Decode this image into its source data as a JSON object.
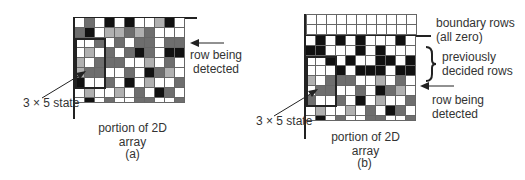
{
  "panels": [
    {
      "id": "a",
      "caption": "(a)",
      "array_label_line1": "portion of 2D",
      "array_label_line2": "array",
      "state_label": "3 × 5 state",
      "row_label_line1": "row being",
      "row_label_line2": "detected",
      "grid": [
        [
          0,
          2,
          0,
          3,
          0,
          3,
          0,
          0,
          1,
          3,
          0
        ],
        [
          2,
          3,
          0,
          1,
          1,
          2,
          1,
          2,
          0,
          0,
          0
        ],
        [
          0,
          0,
          2,
          0,
          2,
          0,
          2,
          2,
          0,
          2,
          2
        ],
        [
          0,
          1,
          0,
          2,
          0,
          2,
          3,
          2,
          0,
          3,
          3
        ],
        [
          1,
          0,
          2,
          2,
          2,
          0,
          0,
          1,
          0,
          2,
          0
        ],
        [
          1,
          2,
          2,
          0,
          0,
          2,
          0,
          3,
          2,
          1,
          0
        ],
        [
          3,
          0,
          0,
          2,
          0,
          3,
          0,
          1,
          0,
          0,
          2
        ],
        [
          0,
          1,
          0,
          0,
          1,
          0,
          2,
          0,
          3,
          2,
          0
        ],
        [
          0,
          3,
          0,
          2,
          0,
          0,
          2,
          2,
          0,
          0,
          2
        ]
      ]
    },
    {
      "id": "b",
      "caption": "(b)",
      "array_label_line1": "portion of 2D",
      "array_label_line2": "array",
      "state_label": "3 × 5 state",
      "boundary_label_line1": "boundary rows",
      "boundary_label_line2": "(all zero)",
      "decided_label_line1": "previously",
      "decided_label_line2": "decided rows",
      "row_label_line1": "row being",
      "row_label_line2": "detected",
      "boundary_grid": [
        [
          0,
          0,
          0,
          0,
          0,
          0,
          0,
          0,
          0,
          0,
          0
        ],
        [
          0,
          0,
          0,
          0,
          0,
          0,
          0,
          0,
          0,
          0,
          0
        ]
      ],
      "grid": [
        [
          0,
          3,
          0,
          3,
          0,
          3,
          0,
          0,
          0,
          3,
          0
        ],
        [
          3,
          3,
          0,
          0,
          0,
          3,
          0,
          3,
          0,
          0,
          0
        ],
        [
          0,
          0,
          3,
          0,
          3,
          0,
          0,
          3,
          3,
          0,
          3
        ],
        [
          0,
          0,
          0,
          3,
          0,
          3,
          3,
          3,
          0,
          3,
          3
        ],
        [
          1,
          0,
          2,
          2,
          2,
          0,
          0,
          1,
          0,
          2,
          0
        ],
        [
          0,
          2,
          2,
          0,
          0,
          2,
          0,
          3,
          2,
          1,
          0
        ],
        [
          2,
          0,
          0,
          2,
          0,
          3,
          0,
          1,
          0,
          0,
          2
        ],
        [
          0,
          1,
          0,
          0,
          1,
          0,
          2,
          0,
          3,
          2,
          0
        ],
        [
          0,
          3,
          0,
          2,
          0,
          0,
          2,
          2,
          0,
          0,
          2
        ]
      ]
    }
  ],
  "legend": {
    "c0": "#ffffff",
    "c1": "#b0b0b0",
    "c2": "#6e6e6e",
    "c3": "#111111"
  }
}
